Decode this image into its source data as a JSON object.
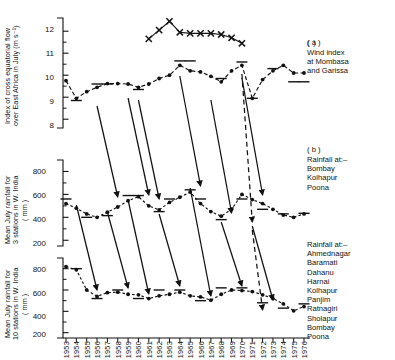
{
  "figure": {
    "panels": [
      {
        "id": "a",
        "tag": "( a )",
        "caption": "Wind index\nat Mombasa\nand Garissa",
        "ylabel": "Index of cross equatorial flow\nover East Africa in July (m s⁻¹)",
        "yticks": [
          "12",
          "11",
          "10",
          "9",
          "8"
        ]
      },
      {
        "id": "b",
        "tag": "( b )",
        "caption": "Rainfall at:–\nBombay\nKolhapur\nPoona",
        "ylabel": "Mean July rainfall for\n3 stations in W. India\n( mm )",
        "yticks": [
          "800",
          "600",
          "400",
          "200"
        ]
      },
      {
        "id": "c",
        "tag": "",
        "caption": "Rainfall at:–\nAhmednagar\nBaramati\nDahanu\nHarnai\nKolhapur\nPanjim\nRatnagiri\nSholapur\nBombay\nPoona",
        "ylabel": "Mean July rainfall for\n10 stations in W. India\n( mm )",
        "yticks": [
          "800",
          "600",
          "400",
          "200"
        ]
      }
    ],
    "xticks": [
      "1953",
      "1954",
      "1955",
      "1956",
      "1957",
      "1958",
      "1959",
      "1960",
      "1961",
      "1962",
      "1963",
      "1964",
      "1965",
      "1966",
      "1967",
      "1968",
      "1969",
      "1970",
      "1971",
      "1972",
      "1973",
      "1974",
      "1975",
      "1976"
    ]
  },
  "chart_data": {
    "type": "line",
    "title": "",
    "xlabel": "",
    "grid": false,
    "legend": "right",
    "x": [
      1953,
      1954,
      1955,
      1956,
      1957,
      1958,
      1959,
      1960,
      1961,
      1962,
      1963,
      1964,
      1965,
      1966,
      1967,
      1968,
      1969,
      1970,
      1971,
      1972,
      1973,
      1974,
      1975,
      1976
    ],
    "panels": [
      {
        "id": "a",
        "ylabel": "Index of cross equatorial flow over East Africa in July (m s-1)",
        "ylim": [
          7.6,
          12.6
        ],
        "yticks": [
          8,
          9,
          10,
          11,
          12
        ],
        "series": [
          {
            "name": "Wind index at Mombasa and Garissa",
            "marker": "dot",
            "linestyle": "dashed",
            "values": [
              9.75,
              8.95,
              9.25,
              9.45,
              9.62,
              9.62,
              9.6,
              9.45,
              9.6,
              9.85,
              10.0,
              10.45,
              10.2,
              10.15,
              9.95,
              9.7,
              10.2,
              10.45,
              8.95,
              9.8,
              10.2,
              10.45,
              10.1,
              10.1
            ]
          },
          {
            "name": "Upper index series",
            "marker": "cross",
            "linestyle": "solid",
            "x": [
              1961,
              1962,
              1963,
              1964,
              1965,
              1966,
              1967,
              1968,
              1969,
              1970
            ],
            "values": [
              11.65,
              12.05,
              12.45,
              11.95,
              11.9,
              11.9,
              11.9,
              11.85,
              11.7,
              11.45
            ]
          }
        ]
      },
      {
        "id": "b",
        "ylabel": "Mean July rainfall for 3 stations in W. India (mm)",
        "ylim": [
          150,
          900
        ],
        "yticks": [
          200,
          400,
          600,
          800
        ],
        "series": [
          {
            "name": "Rainfall at Bombay, Kolhapur, Poona",
            "marker": "dot",
            "linestyle": "dotted",
            "values": [
              520,
              480,
              430,
              400,
              445,
              490,
              545,
              580,
              500,
              465,
              530,
              575,
              620,
              520,
              450,
              410,
              470,
              600,
              555,
              520,
              470,
              420,
              400,
              430
            ]
          }
        ]
      },
      {
        "id": "c",
        "ylabel": "Mean July rainfall for 10 stations in W. India (mm)",
        "ylim": [
          150,
          900
        ],
        "yticks": [
          200,
          400,
          600,
          800
        ],
        "series": [
          {
            "name": "Rainfall at 10 stations in W. India",
            "marker": "dot",
            "linestyle": "dotted",
            "values": [
              820,
              790,
              600,
              540,
              575,
              580,
              560,
              555,
              520,
              545,
              560,
              580,
              545,
              535,
              505,
              560,
              600,
              595,
              585,
              555,
              520,
              470,
              405,
              445
            ]
          }
        ]
      }
    ],
    "annotations": {
      "description": "Downward arrows link wind-index maxima/minima in panel (a) to rainfall extrema in panels (b) and (c); horizontal dashes mark individual yearly reference levels.",
      "arrows_solid_years": [
        1956,
        1959,
        1960,
        1963,
        1966,
        1967,
        1970,
        1972
      ],
      "arrow_dashed_years": [
        1971
      ]
    }
  }
}
